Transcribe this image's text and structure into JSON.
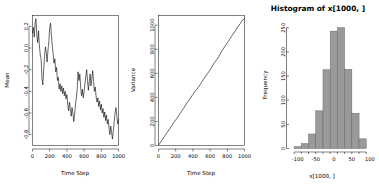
{
  "figure": {
    "background": "#ffffff",
    "panel_count": 3,
    "line_color": "#000000",
    "hist_fill": "#9a9a9a",
    "hist_border": "#606060"
  },
  "chart_data": [
    {
      "type": "line",
      "title": "",
      "xlabel": "Time Step",
      "ylabel": "Mean",
      "xlim": [
        0,
        1000
      ],
      "ylim": [
        -0.9,
        0.3
      ],
      "xticks": [
        0,
        200,
        400,
        600,
        800,
        1000
      ],
      "xticklabels": [
        "0",
        "200",
        "400",
        "600",
        "800",
        "1000"
      ],
      "yticks": [
        0.2,
        0.0,
        -0.2,
        -0.4,
        -0.6,
        -0.8
      ],
      "yticklabels": [
        "0.2",
        "0.0",
        "-0.2",
        "-0.4",
        "-0.6",
        "-0.8"
      ],
      "grid": false,
      "legend": "none",
      "x": [
        0,
        10,
        20,
        30,
        40,
        50,
        60,
        70,
        80,
        90,
        100,
        110,
        120,
        130,
        140,
        150,
        160,
        170,
        180,
        190,
        200,
        210,
        220,
        230,
        240,
        250,
        260,
        270,
        280,
        290,
        300,
        310,
        320,
        330,
        340,
        350,
        360,
        370,
        380,
        390,
        400,
        410,
        420,
        430,
        440,
        450,
        460,
        470,
        480,
        490,
        500,
        510,
        520,
        530,
        540,
        550,
        560,
        570,
        580,
        590,
        600,
        610,
        620,
        630,
        640,
        650,
        660,
        670,
        680,
        690,
        700,
        710,
        720,
        730,
        740,
        750,
        760,
        770,
        780,
        790,
        800,
        810,
        820,
        830,
        840,
        850,
        860,
        870,
        880,
        890,
        900,
        910,
        920,
        930,
        940,
        950,
        960,
        970,
        980,
        990,
        1000
      ],
      "values": [
        0.14,
        0.19,
        0.1,
        0.23,
        0.27,
        0.12,
        0.05,
        0.16,
        0.02,
        -0.06,
        -0.1,
        -0.28,
        -0.34,
        -0.2,
        -0.08,
        0.01,
        -0.04,
        -0.13,
        -0.02,
        0.06,
        0.19,
        0.23,
        0.12,
        0.02,
        -0.05,
        -0.14,
        -0.1,
        -0.22,
        -0.18,
        -0.3,
        -0.27,
        -0.38,
        -0.33,
        -0.4,
        -0.35,
        -0.42,
        -0.37,
        -0.44,
        -0.4,
        -0.47,
        -0.43,
        -0.52,
        -0.58,
        -0.5,
        -0.56,
        -0.63,
        -0.55,
        -0.6,
        -0.68,
        -0.61,
        -0.52,
        -0.46,
        -0.38,
        -0.22,
        -0.3,
        -0.24,
        -0.36,
        -0.44,
        -0.38,
        -0.46,
        -0.4,
        -0.33,
        -0.26,
        -0.2,
        -0.3,
        -0.39,
        -0.31,
        -0.24,
        -0.35,
        -0.28,
        -0.21,
        -0.31,
        -0.4,
        -0.36,
        -0.45,
        -0.5,
        -0.46,
        -0.54,
        -0.49,
        -0.57,
        -0.52,
        -0.6,
        -0.56,
        -0.64,
        -0.59,
        -0.67,
        -0.62,
        -0.7,
        -0.66,
        -0.74,
        -0.8,
        -0.72,
        -0.78,
        -0.84,
        -0.76,
        -0.68,
        -0.6,
        -0.55,
        -0.62,
        -0.7,
        -0.66
      ]
    },
    {
      "type": "line",
      "title": "",
      "xlabel": "Time Step",
      "ylabel": "Variance",
      "xlim": [
        0,
        1000
      ],
      "ylim": [
        0,
        1080
      ],
      "xticks": [
        0,
        200,
        400,
        600,
        800,
        1000
      ],
      "xticklabels": [
        "0",
        "200",
        "400",
        "600",
        "800",
        "1000"
      ],
      "yticks": [
        0,
        200,
        400,
        600,
        800,
        1000
      ],
      "yticklabels": [
        "0",
        "200",
        "400",
        "600",
        "800",
        "1000"
      ],
      "grid": false,
      "legend": "none",
      "x": [
        0,
        25,
        50,
        75,
        100,
        125,
        150,
        175,
        200,
        225,
        250,
        275,
        300,
        325,
        350,
        375,
        400,
        425,
        450,
        475,
        500,
        525,
        550,
        575,
        600,
        625,
        650,
        675,
        700,
        725,
        750,
        775,
        800,
        825,
        850,
        875,
        900,
        925,
        950,
        975,
        1000
      ],
      "values": [
        2,
        28,
        55,
        82,
        108,
        133,
        160,
        188,
        212,
        238,
        265,
        292,
        318,
        348,
        372,
        398,
        424,
        452,
        470,
        496,
        524,
        552,
        578,
        602,
        628,
        660,
        688,
        712,
        736,
        772,
        800,
        826,
        852,
        880,
        908,
        934,
        960,
        988,
        1012,
        1040,
        1052
      ]
    },
    {
      "type": "bar",
      "title": "Histogram of x[1000, ]",
      "xlabel": "x[1000, ]",
      "ylabel": "Frequency",
      "xlim": [
        -120,
        110
      ],
      "ylim": [
        0,
        265
      ],
      "xticks": [
        -100,
        -50,
        0,
        50,
        100
      ],
      "xticklabels": [
        "-100",
        "-50",
        "0",
        "50",
        "100"
      ],
      "yticks": [
        0,
        50,
        100,
        150,
        200,
        250
      ],
      "yticklabels": [
        "0",
        "50",
        "100",
        "150",
        "200",
        "250"
      ],
      "grid": false,
      "legend": "none",
      "bin_edges": [
        -110,
        -90,
        -70,
        -50,
        -30,
        -10,
        10,
        30,
        50,
        70,
        90
      ],
      "categories": [
        "-110:-90",
        "-90:-70",
        "-70:-50",
        "-50:-30",
        "-30:-10",
        "-10:10",
        "10:30",
        "30:50",
        "50:70",
        "70:90"
      ],
      "values": [
        4,
        10,
        30,
        78,
        163,
        243,
        250,
        164,
        73,
        20
      ]
    }
  ]
}
